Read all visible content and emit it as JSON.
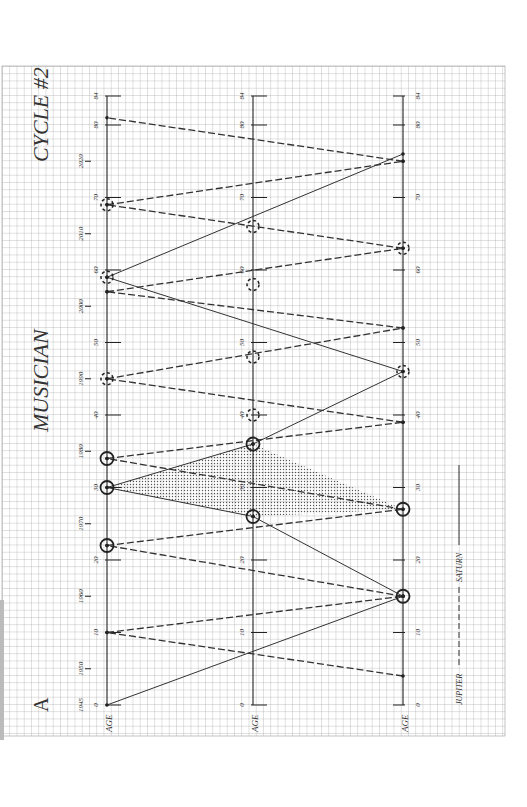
{
  "title": "MUSICIAN",
  "subtitle": "CYCLE #2",
  "panel_letter": "A",
  "legend": [
    {
      "label": "JUPITER",
      "style": "dashed"
    },
    {
      "label": "SATURN",
      "style": "solid"
    }
  ],
  "axis_label": "AGE",
  "chart_data": {
    "type": "line",
    "orientation": "rotated 90° (age axes run vertically, bottom=0, top=84)",
    "axes": [
      {
        "name": "left",
        "label": "AGE",
        "range": [
          0,
          84
        ],
        "ticks": [
          0,
          10,
          20,
          30,
          40,
          50,
          60,
          70,
          80,
          84
        ],
        "year_ticks": [
          {
            "age": 0,
            "year": "1945"
          },
          {
            "age": 5,
            "year": "1950"
          },
          {
            "age": 15,
            "year": "1960"
          },
          {
            "age": 25,
            "year": "1970"
          },
          {
            "age": 35,
            "year": "1980"
          },
          {
            "age": 45,
            "year": "1990"
          },
          {
            "age": 55,
            "year": "2000"
          },
          {
            "age": 65,
            "year": "2010"
          },
          {
            "age": 75,
            "year": "2020"
          }
        ]
      },
      {
        "name": "middle",
        "label": "AGE",
        "range": [
          0,
          84
        ],
        "ticks": [
          0,
          10,
          20,
          30,
          40,
          50,
          60,
          70,
          80,
          84
        ]
      },
      {
        "name": "right",
        "label": "AGE",
        "range": [
          0,
          84
        ],
        "ticks": [
          0,
          10,
          20,
          30,
          40,
          50,
          60,
          70,
          80,
          84
        ]
      }
    ],
    "series": [
      {
        "name": "SATURN",
        "style": "solid",
        "segments": [
          [
            [
              "left",
              0
            ],
            [
              "right",
              15
            ]
          ],
          [
            [
              "right",
              15
            ],
            [
              "middle",
              26
            ]
          ],
          [
            [
              "middle",
              26
            ],
            [
              "left",
              30
            ]
          ],
          [
            [
              "left",
              30
            ],
            [
              "middle",
              36
            ]
          ],
          [
            [
              "middle",
              36
            ],
            [
              "right",
              46
            ]
          ],
          [
            [
              "right",
              46
            ],
            [
              "left",
              59
            ]
          ],
          [
            [
              "left",
              59
            ],
            [
              "right",
              76
            ]
          ]
        ]
      },
      {
        "name": "JUPITER",
        "style": "dashed",
        "segments": [
          [
            [
              "right",
              4
            ],
            [
              "left",
              10
            ]
          ],
          [
            [
              "left",
              10
            ],
            [
              "right",
              15
            ]
          ],
          [
            [
              "right",
              15
            ],
            [
              "left",
              22
            ]
          ],
          [
            [
              "left",
              22
            ],
            [
              "right",
              27
            ]
          ],
          [
            [
              "right",
              27
            ],
            [
              "left",
              34
            ]
          ],
          [
            [
              "left",
              34
            ],
            [
              "right",
              39
            ]
          ],
          [
            [
              "right",
              39
            ],
            [
              "left",
              45
            ]
          ],
          [
            [
              "left",
              45
            ],
            [
              "right",
              52
            ]
          ],
          [
            [
              "right",
              52
            ],
            [
              "left",
              57
            ]
          ],
          [
            [
              "left",
              57
            ],
            [
              "right",
              63
            ]
          ],
          [
            [
              "right",
              63
            ],
            [
              "left",
              69
            ]
          ],
          [
            [
              "left",
              69
            ],
            [
              "right",
              75
            ]
          ],
          [
            [
              "right",
              75
            ],
            [
              "left",
              81
            ]
          ]
        ]
      }
    ],
    "conjunction_markers_solid": [
      [
        "left",
        22
      ],
      [
        "left",
        30
      ],
      [
        "left",
        34
      ],
      [
        "middle",
        26
      ],
      [
        "middle",
        36
      ],
      [
        "right",
        15
      ],
      [
        "right",
        27
      ]
    ],
    "conjunction_markers_dashed": [
      [
        "left",
        45
      ],
      [
        "left",
        59
      ],
      [
        "left",
        69
      ],
      [
        "middle",
        40
      ],
      [
        "middle",
        48
      ],
      [
        "middle",
        58
      ],
      [
        "middle",
        66
      ],
      [
        "right",
        46
      ],
      [
        "right",
        63
      ]
    ],
    "shaded_region": [
      [
        "left",
        30
      ],
      [
        "middle",
        36
      ],
      [
        "right",
        27
      ],
      [
        "middle",
        26
      ]
    ],
    "grid": true,
    "legend_position": "bottom-right (rotated)"
  }
}
